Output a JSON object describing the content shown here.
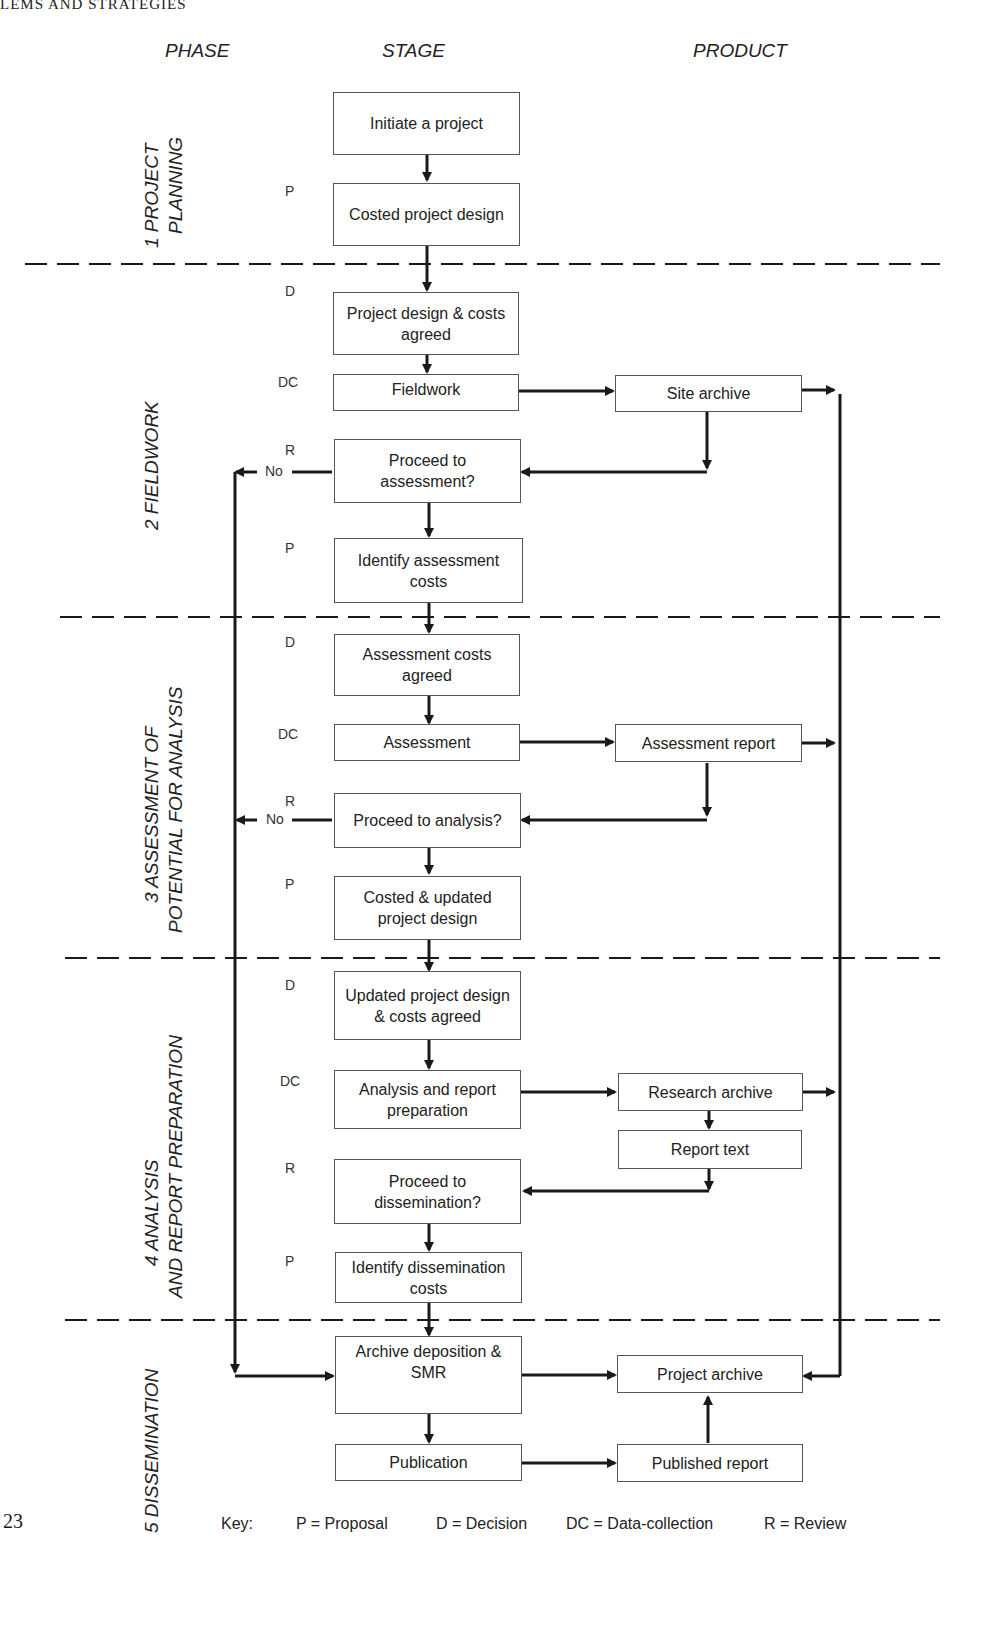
{
  "page": {
    "running_head": "LEMS AND STRATEGIES",
    "page_number": "23"
  },
  "columns": {
    "phase": "PHASE",
    "stage": "STAGE",
    "product": "PRODUCT"
  },
  "phases": [
    {
      "number": "1",
      "line1": "1   PROJECT",
      "line2": "PLANNING"
    },
    {
      "number": "2",
      "line1": "2   FIELDWORK",
      "line2": ""
    },
    {
      "number": "3",
      "line1": "3   ASSESSMENT OF",
      "line2": "POTENTIAL FOR ANALYSIS"
    },
    {
      "number": "4",
      "line1": "4   ANALYSIS",
      "line2": "AND REPORT PREPARATION"
    },
    {
      "number": "5",
      "line1": "5 DISSEMINATION",
      "line2": ""
    }
  ],
  "stages": [
    {
      "id": "initiate",
      "code": "",
      "text": "Initiate a project"
    },
    {
      "id": "costed-design",
      "code": "P",
      "text": "Costed project design"
    },
    {
      "id": "design-agreed",
      "code": "D",
      "text": "Project design & costs agreed"
    },
    {
      "id": "fieldwork",
      "code": "DC",
      "text": "Fieldwork"
    },
    {
      "id": "proceed-assessment",
      "code": "R",
      "text": "Proceed to assessment?"
    },
    {
      "id": "identify-assessment-costs",
      "code": "P",
      "text": "Identify assessment costs"
    },
    {
      "id": "assessment-costs-agreed",
      "code": "D",
      "text": "Assessment  costs agreed"
    },
    {
      "id": "assessment",
      "code": "DC",
      "text": "Assessment"
    },
    {
      "id": "proceed-analysis",
      "code": "R",
      "text": "Proceed to analysis?"
    },
    {
      "id": "costed-updated-design",
      "code": "P",
      "text": "Costed & updated project design"
    },
    {
      "id": "updated-design-agreed",
      "code": "D",
      "text": "Updated project design & costs agreed"
    },
    {
      "id": "analysis-report-prep",
      "code": "DC",
      "text": "Analysis and report preparation"
    },
    {
      "id": "proceed-dissemination",
      "code": "R",
      "text": "Proceed to dissemination?"
    },
    {
      "id": "identify-dissemination-costs",
      "code": "P",
      "text": "Identify dissemination costs"
    },
    {
      "id": "archive-deposition",
      "code": "",
      "text": "Archive deposition & SMR"
    },
    {
      "id": "publication",
      "code": "",
      "text": "Publication"
    }
  ],
  "products": [
    {
      "id": "site-archive",
      "text": "Site archive"
    },
    {
      "id": "assessment-report",
      "text": "Assessment report"
    },
    {
      "id": "research-archive",
      "text": "Research archive"
    },
    {
      "id": "report-text",
      "text": "Report text"
    },
    {
      "id": "project-archive",
      "text": "Project archive"
    },
    {
      "id": "published-report",
      "text": "Published report"
    }
  ],
  "decision_labels": {
    "no_assessment": "No",
    "no_analysis": "No"
  },
  "key": {
    "title": "Key:",
    "items": [
      "P = Proposal",
      "D = Decision",
      "DC = Data-collection",
      "R = Review"
    ]
  },
  "colors": {
    "line": "#1a1a1a",
    "box_border": "#555555",
    "text": "#222222"
  }
}
